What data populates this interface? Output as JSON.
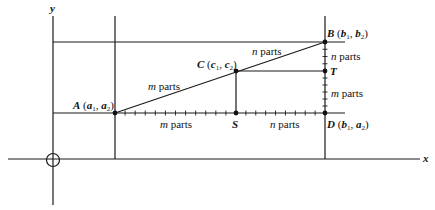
{
  "axes": {
    "x_label": "x",
    "y_label": "y"
  },
  "points": {
    "A": {
      "name": "A",
      "coords": "(a₁, a₂)",
      "c1": "a",
      "s1": "1",
      "c2": "a",
      "s2": "2"
    },
    "B": {
      "name": "B",
      "coords": "(b₁, b₂)",
      "c1": "b",
      "s1": "1",
      "c2": "b",
      "s2": "2"
    },
    "C": {
      "name": "C",
      "coords": "(c₁, c₂)",
      "c1": "c",
      "s1": "1",
      "c2": "c",
      "s2": "2"
    },
    "D": {
      "name": "D",
      "coords": "(b₁, a₂)",
      "c1": "b",
      "s1": "1",
      "c2": "a",
      "s2": "2"
    },
    "S": {
      "name": "S"
    },
    "T": {
      "name": "T"
    }
  },
  "segment_labels": {
    "AC": {
      "var": "m",
      "word": "parts"
    },
    "CB": {
      "var": "n",
      "word": "parts"
    },
    "AS": {
      "var": "m",
      "word": "parts"
    },
    "SD": {
      "var": "n",
      "word": "parts"
    },
    "BT": {
      "var": "n",
      "word": "parts"
    },
    "TD": {
      "var": "m",
      "word": "parts"
    }
  },
  "tick_counts": {
    "AS": 12,
    "SD": 9,
    "BT": 4,
    "TD": 6
  }
}
